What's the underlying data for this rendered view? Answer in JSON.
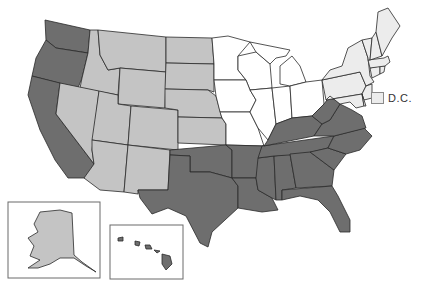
{
  "map": {
    "type": "choropleth",
    "region": "United States",
    "colors": {
      "dark": "#6e6e6e",
      "medium": "#c4c4c4",
      "white": "#ffffff",
      "light": "#ececec",
      "border": "#2a2a2a"
    },
    "categories": {
      "dark": [
        "WA",
        "OR",
        "CA",
        "TX",
        "OK",
        "AR",
        "LA",
        "MS",
        "AL",
        "GA",
        "FL",
        "SC",
        "NC",
        "TN",
        "KY",
        "VA",
        "WV",
        "HI"
      ],
      "medium": [
        "ID",
        "MT",
        "WY",
        "NV",
        "UT",
        "CO",
        "AZ",
        "NM",
        "ND",
        "SD",
        "NE",
        "KS",
        "AK"
      ],
      "white": [
        "MN",
        "WI",
        "IA",
        "MO",
        "IL",
        "IN",
        "MI",
        "OH"
      ],
      "light": [
        "PA",
        "NY",
        "NJ",
        "CT",
        "RI",
        "MA",
        "VT",
        "NH",
        "ME",
        "MD",
        "DE",
        "DC"
      ]
    },
    "legend": {
      "dc_label": "D.C.",
      "dc_color": "#ececec"
    },
    "insets": [
      "Alaska",
      "Hawaii"
    ]
  }
}
